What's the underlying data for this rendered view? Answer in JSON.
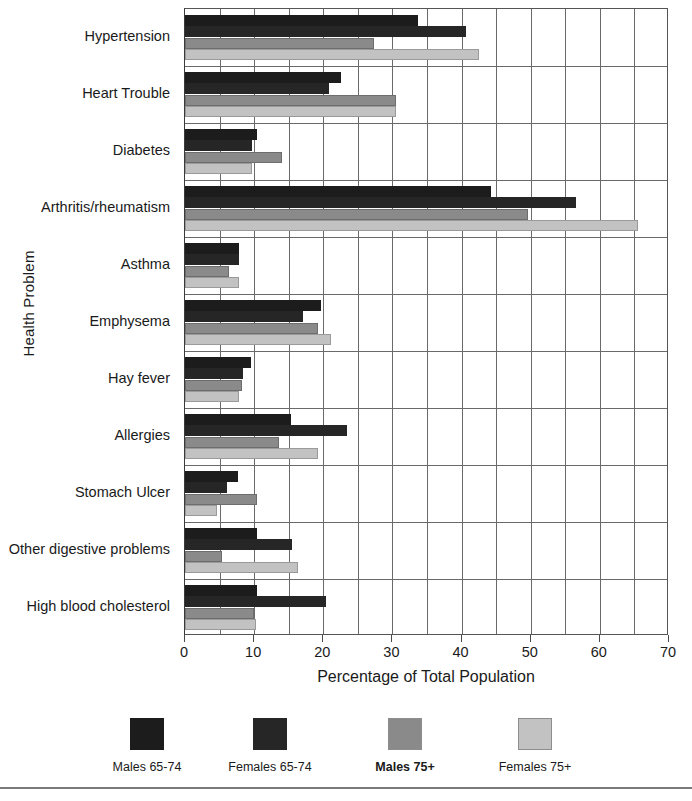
{
  "chart_data": {
    "type": "bar",
    "orientation": "horizontal",
    "title": "",
    "xlabel": "Percentage of Total Population",
    "ylabel": "Health Problem",
    "xlim": [
      0,
      70
    ],
    "xticks": [
      0,
      10,
      20,
      30,
      40,
      50,
      60,
      70
    ],
    "grid": "vertical-major-and-minor",
    "legend_position": "bottom",
    "categories": [
      "Hypertension",
      "Heart Trouble",
      "Diabetes",
      "Arthritis/rheumatism",
      "Asthma",
      "Emphysema",
      "Hay fever",
      "Allergies",
      "Stomach Ulcer",
      "Other digestive problems",
      "High blood cholesterol"
    ],
    "series": [
      {
        "name": "Males 65-74",
        "color": "#1c1c1c",
        "values": [
          33.7,
          22.6,
          10.4,
          44.3,
          7.8,
          19.7,
          9.5,
          15.3,
          7.7,
          10.4,
          10.4
        ]
      },
      {
        "name": "Females 65-74",
        "color": "#262626",
        "values": [
          40.6,
          20.8,
          9.7,
          56.6,
          7.8,
          17.1,
          8.4,
          23.4,
          6.1,
          15.5,
          20.4
        ]
      },
      {
        "name": "Males 75+",
        "color": "#8a8a8a",
        "values": [
          27.3,
          30.5,
          14.0,
          49.6,
          6.4,
          19.2,
          8.2,
          13.6,
          10.4,
          5.4,
          10.0
        ]
      },
      {
        "name": "Females 75+",
        "color": "#c2c2c2",
        "values": [
          42.5,
          30.5,
          9.7,
          65.5,
          7.8,
          21.1,
          7.8,
          19.2,
          4.6,
          16.3,
          10.3
        ]
      }
    ]
  }
}
